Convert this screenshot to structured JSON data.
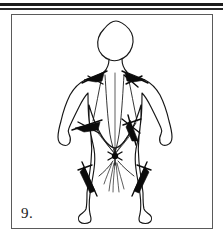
{
  "page": {
    "background_color": "#ffffff",
    "ink_color": "#161616"
  },
  "top_rule": {
    "name": "double-horizontal-rule",
    "thick_color": "#1c1c1c",
    "thin_color": "#2a2a2a"
  },
  "figure": {
    "number_label": "9.",
    "caption": "",
    "frame_color": "#5a5a5a",
    "annotation_type": "needle-and-meridian-markings",
    "markings": [
      {
        "id": "left-shoulder",
        "label": ""
      },
      {
        "id": "right-shoulder",
        "label": ""
      },
      {
        "id": "left-thigh",
        "label": ""
      },
      {
        "id": "right-thigh",
        "label": ""
      },
      {
        "id": "groin-node",
        "label": ""
      },
      {
        "id": "left-calf",
        "label": ""
      },
      {
        "id": "right-calf",
        "label": ""
      }
    ]
  }
}
